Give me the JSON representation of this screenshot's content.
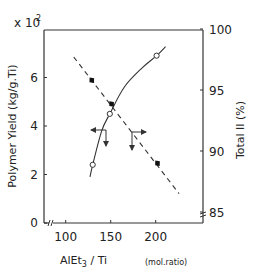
{
  "chart_data": {
    "type": "line",
    "title": "",
    "xlabel_main": "AlEt",
    "xlabel_sub": "3",
    "xlabel_rest": " / Ti",
    "xlabel_unit": "(mol.ratio)",
    "ylabel_left": "Polymer Yield (kg/g.Ti)",
    "ylabel_left_multiplier": "x 10",
    "ylabel_left_multiplier_exp": "2",
    "ylabel_right": "Total II (%)",
    "xlim": [
      76,
      252
    ],
    "ylim_left": [
      0,
      8
    ],
    "ylim_right": [
      84.1,
      100
    ],
    "x_ticks": [
      100,
      150,
      200
    ],
    "y_left_ticks": [
      0,
      2,
      4,
      6
    ],
    "y_right_ticks": [
      85,
      90,
      95,
      100
    ],
    "x_axis_break": true,
    "y_right_axis_break": true,
    "grid": false,
    "series": [
      {
        "name": "Polymer Yield",
        "axis": "left",
        "marker": "open-circle",
        "line": "solid",
        "points": [
          {
            "x": 130,
            "y": 2.4
          },
          {
            "x": 149,
            "y": 4.5
          },
          {
            "x": 201,
            "y": 6.9
          }
        ],
        "curve": [
          {
            "x": 127,
            "y": 1.9
          },
          {
            "x": 130,
            "y": 2.4
          },
          {
            "x": 140,
            "y": 3.8
          },
          {
            "x": 149,
            "y": 4.5
          },
          {
            "x": 165,
            "y": 5.6
          },
          {
            "x": 185,
            "y": 6.4
          },
          {
            "x": 201,
            "y": 6.9
          },
          {
            "x": 211,
            "y": 7.27
          }
        ]
      },
      {
        "name": "Total II",
        "axis": "right",
        "marker": "filled-diamond",
        "line": "dashed",
        "points": [
          {
            "x": 129,
            "y": 95.8
          },
          {
            "x": 151,
            "y": 93.85
          },
          {
            "x": 202,
            "y": 89.0
          }
        ],
        "curve": [
          {
            "x": 109,
            "y": 97.7
          },
          {
            "x": 226,
            "y": 86.5
          }
        ]
      }
    ],
    "annotations": [
      {
        "type": "axis-pointer",
        "at": {
          "x": 144,
          "y_left": 3.8
        },
        "directions": [
          "left",
          "down"
        ]
      },
      {
        "type": "axis-pointer",
        "at": {
          "x": 173,
          "y_right": 91.7
        },
        "directions": [
          "right",
          "down"
        ]
      }
    ]
  }
}
